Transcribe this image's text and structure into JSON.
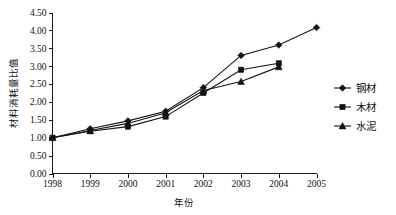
{
  "chart_data": {
    "type": "line",
    "title": "",
    "xlabel": "年份",
    "ylabel": "材料消耗量比值",
    "categories": [
      "1998",
      "1999",
      "2000",
      "2001",
      "2002",
      "2003",
      "2004",
      "2005"
    ],
    "x": [
      1998,
      1999,
      2000,
      2001,
      2002,
      2003,
      2004,
      2005
    ],
    "xlim": [
      1998,
      2005
    ],
    "ylim": [
      0.0,
      4.5
    ],
    "ytick_labels": [
      "0.00",
      "0.50",
      "1.00",
      "1.50",
      "2.00",
      "2.50",
      "3.00",
      "3.50",
      "4.00",
      "4.50"
    ],
    "ytick_values": [
      0.0,
      0.5,
      1.0,
      1.5,
      2.0,
      2.5,
      3.0,
      3.5,
      4.0,
      4.5
    ],
    "grid": false,
    "legend_position": "right",
    "series": [
      {
        "name": "钢材",
        "marker": "diamond",
        "color": "#141414",
        "x": [
          1998,
          1999,
          2000,
          2001,
          2002,
          2003,
          2004,
          2005
        ],
        "values": [
          1.0,
          1.25,
          1.47,
          1.74,
          2.4,
          3.3,
          3.59,
          4.08
        ]
      },
      {
        "name": "木材",
        "marker": "square",
        "color": "#141414",
        "x": [
          1998,
          1999,
          2000,
          2001,
          2002,
          2003,
          2004
        ],
        "values": [
          1.0,
          1.18,
          1.31,
          1.59,
          2.25,
          2.9,
          3.08
        ]
      },
      {
        "name": "水泥",
        "marker": "triangle",
        "color": "#141414",
        "x": [
          1998,
          1999,
          2000,
          2001,
          2002,
          2003,
          2004
        ],
        "values": [
          1.0,
          1.2,
          1.4,
          1.7,
          2.32,
          2.57,
          2.98
        ]
      }
    ]
  },
  "legend": {
    "entries": [
      {
        "label": "钢材"
      },
      {
        "label": "木材"
      },
      {
        "label": "水泥"
      }
    ]
  },
  "axes": {
    "x_title": "年份",
    "y_title": "材料消耗量比值"
  }
}
